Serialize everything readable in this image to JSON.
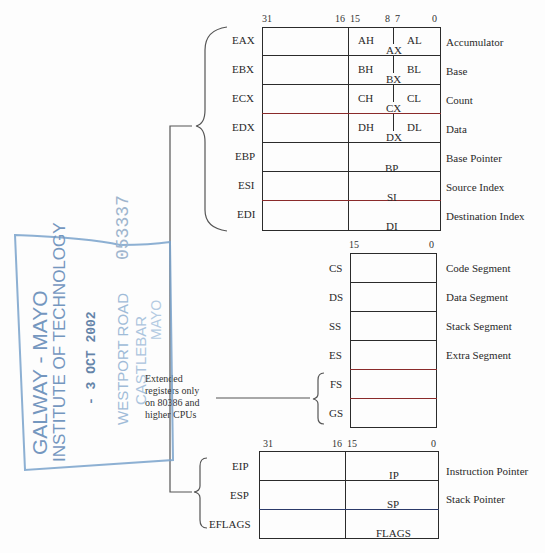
{
  "general_registers": {
    "bit_labels": {
      "b31": "31",
      "b16": "16",
      "b15": "15",
      "b8": "8",
      "b7": "7",
      "b0": "0"
    },
    "rows": [
      {
        "name": "EAX",
        "high": "AH",
        "low": "AL",
        "word": "AX",
        "desc": "Accumulator"
      },
      {
        "name": "EBX",
        "high": "BH",
        "low": "BL",
        "word": "BX",
        "desc": "Base"
      },
      {
        "name": "ECX",
        "high": "CH",
        "low": "CL",
        "word": "CX",
        "desc": "Count"
      },
      {
        "name": "EDX",
        "high": "DH",
        "low": "DL",
        "word": "DX",
        "desc": "Data"
      },
      {
        "name": "EBP",
        "word": "BP",
        "desc": "Base Pointer"
      },
      {
        "name": "ESI",
        "word": "SI",
        "desc": "Source Index"
      },
      {
        "name": "EDI",
        "word": "DI",
        "desc": "Destination Index"
      }
    ]
  },
  "segment_registers": {
    "bit_labels": {
      "b15": "15",
      "b0": "0"
    },
    "rows": [
      {
        "name": "CS",
        "desc": "Code Segment"
      },
      {
        "name": "DS",
        "desc": "Data Segment"
      },
      {
        "name": "SS",
        "desc": "Stack Segment"
      },
      {
        "name": "ES",
        "desc": "Extra Segment"
      },
      {
        "name": "FS",
        "desc": ""
      },
      {
        "name": "GS",
        "desc": ""
      }
    ]
  },
  "pointer_registers": {
    "bit_labels": {
      "b31": "31",
      "b16": "16",
      "b15": "15",
      "b0": "0"
    },
    "rows": [
      {
        "name": "EIP",
        "word": "IP",
        "desc": "Instruction Pointer"
      },
      {
        "name": "ESP",
        "word": "SP",
        "desc": "Stack Pointer"
      },
      {
        "name": "EFLAGS",
        "word": "FLAGS",
        "desc": ""
      }
    ]
  },
  "note": {
    "lines": [
      "Extended",
      "registers only",
      "on 80386 and",
      "higher CPUs"
    ]
  },
  "stamp": {
    "line1": "GALWAY - MAYO",
    "line2": "INSTITUTE OF TECHNOLOGY",
    "date": "- 3 OCT 2002",
    "addr1": "WESTPORT ROAD",
    "addr2": "CASTLEBAR",
    "addr3": "MAYO",
    "number": "053337"
  }
}
